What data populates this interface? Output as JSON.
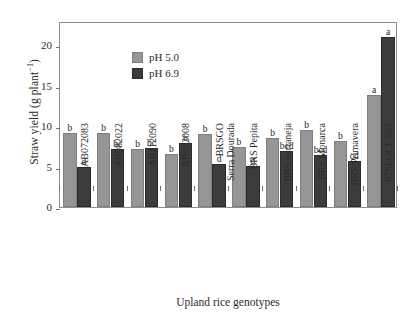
{
  "chart_data": {
    "type": "bar",
    "title": "",
    "xlabel": "Upland rice genotypes",
    "ylabel": "Straw yield (g plant",
    "ylabel_sup": "−1",
    "ylabel_tail": ")",
    "ylim": [
      0,
      23
    ],
    "yticks": [
      0,
      5,
      10,
      15,
      20
    ],
    "ytick_labels": [
      "0",
      "5",
      "10",
      "15",
      "20"
    ],
    "grid": false,
    "legend_position": "top-left",
    "categories": [
      "AB072083",
      "AB082022",
      "AB112090",
      "AB062008",
      "BRSGO",
      "BRS Pepita",
      "BRS Sertaneja",
      "BRS Monarca",
      "BRS Primavera",
      "07SEQCL 563"
    ],
    "categories_line2": [
      "",
      "",
      "",
      "",
      "Serra Dourada",
      "",
      "",
      "",
      "",
      ""
    ],
    "series": [
      {
        "name": "pH 5.0",
        "color": "#969696",
        "values": [
          9.2,
          9.2,
          7.2,
          6.6,
          9.0,
          7.4,
          8.5,
          9.5,
          8.2,
          13.8
        ],
        "labels": [
          "b",
          "b",
          "b",
          "b",
          "b",
          "b",
          "b",
          "b",
          "b",
          "a"
        ]
      },
      {
        "name": "pH 6.9",
        "color": "#3c3c3c",
        "values": [
          4.9,
          7.2,
          7.3,
          7.9,
          5.3,
          5.1,
          6.9,
          6.4,
          5.7,
          21.0
        ],
        "labels": [
          "d",
          "bc",
          "bc",
          "b",
          "d",
          "d",
          "bcd",
          "bcd",
          "cd",
          "a"
        ]
      }
    ]
  },
  "legend": {
    "items": [
      {
        "label": "pH 5.0",
        "swatch": "ph5"
      },
      {
        "label": "pH 6.9",
        "swatch": "ph69"
      }
    ]
  }
}
